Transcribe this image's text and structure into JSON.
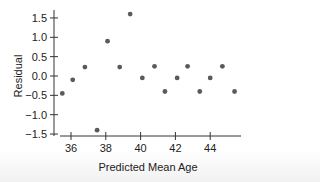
{
  "chart_data": {
    "type": "scatter",
    "title": "",
    "xlabel": "Predicted Mean Age",
    "ylabel": "Residual",
    "xlim": [
      35.0,
      45.8
    ],
    "ylim": [
      -1.55,
      1.7
    ],
    "xticks": [
      36,
      38,
      40,
      42,
      44
    ],
    "xtick_labels": [
      "36",
      "38",
      "40",
      "42",
      "44"
    ],
    "yticks": [
      1.5,
      1.0,
      0.5,
      0.0,
      -0.5,
      -1.0,
      -1.5
    ],
    "ytick_labels": [
      "1.5",
      "1.0",
      "0.5",
      "0.0",
      "−0.5",
      "−1.0",
      "−1.5"
    ],
    "grid": false,
    "legend": null,
    "series": [
      {
        "name": "Residuals",
        "color": "#5a5a5a",
        "x": [
          35.5,
          36.1,
          36.8,
          37.5,
          38.1,
          38.8,
          39.4,
          40.1,
          40.8,
          41.4,
          42.1,
          42.7,
          43.4,
          44.0,
          44.7,
          45.4
        ],
        "y": [
          -0.45,
          -0.1,
          0.23,
          -1.4,
          0.9,
          0.23,
          1.6,
          -0.05,
          0.25,
          -0.4,
          -0.05,
          0.25,
          -0.4,
          -0.05,
          0.25,
          -0.4
        ]
      }
    ]
  }
}
